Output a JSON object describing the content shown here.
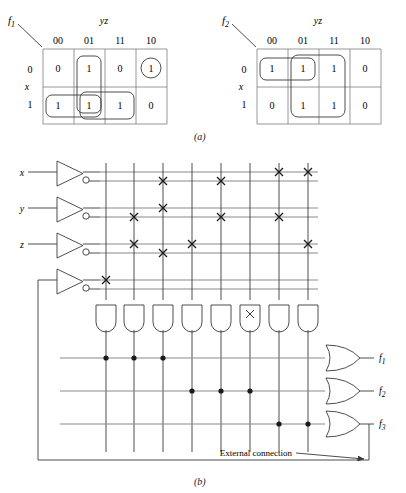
{
  "figure": {
    "caption_a": "(a)",
    "caption_b": "(b)"
  },
  "kmaps": [
    {
      "name": "f1",
      "function_label": "f",
      "function_sub": "1",
      "col_var_label": "yz",
      "row_var_label": "x",
      "col_headers": [
        "00",
        "01",
        "11",
        "10"
      ],
      "row_headers": [
        "0",
        "1"
      ],
      "cells": [
        [
          "0",
          "1",
          "0",
          "1"
        ],
        [
          "1",
          "1",
          "1",
          "0"
        ]
      ],
      "groups": [
        {
          "name": "circle-cell-row0-col10",
          "shape": "circle",
          "row": 0,
          "col_start": 3,
          "col_end": 3
        },
        {
          "name": "vertical-col01",
          "shape": "rect",
          "row_start": 0,
          "row_end": 1,
          "col_start": 1,
          "col_end": 1
        },
        {
          "name": "row1-col00-col01",
          "shape": "rect",
          "row_start": 1,
          "row_end": 1,
          "col_start": 0,
          "col_end": 1
        },
        {
          "name": "row1-col01-col11",
          "shape": "rect",
          "row_start": 1,
          "row_end": 1,
          "col_start": 1,
          "col_end": 2
        }
      ]
    },
    {
      "name": "f2",
      "function_label": "f",
      "function_sub": "2",
      "col_var_label": "yz",
      "row_var_label": "x",
      "col_headers": [
        "00",
        "01",
        "11",
        "10"
      ],
      "row_headers": [
        "0",
        "1"
      ],
      "cells": [
        [
          "1",
          "1",
          "1",
          "0"
        ],
        [
          "0",
          "1",
          "1",
          "0"
        ]
      ],
      "groups": [
        {
          "name": "row0-col00-col01",
          "shape": "rect",
          "row_start": 0,
          "row_end": 0,
          "col_start": 0,
          "col_end": 1
        },
        {
          "name": "col01-col11-both-rows",
          "shape": "rect",
          "row_start": 0,
          "row_end": 1,
          "col_start": 1,
          "col_end": 2
        }
      ]
    }
  ],
  "pla": {
    "inputs": [
      {
        "label": "x",
        "sub": ""
      },
      {
        "label": "y",
        "sub": ""
      },
      {
        "label": "z",
        "sub": ""
      },
      {
        "label": "",
        "sub": ""
      }
    ],
    "input_line_names": [
      "x",
      "x-complement",
      "y",
      "y-complement",
      "z",
      "z-complement",
      "w",
      "w-complement"
    ],
    "and_gate_count": 8,
    "or_gate_count": 3,
    "outputs": [
      {
        "label": "f",
        "sub": "1"
      },
      {
        "label": "f",
        "sub": "2"
      },
      {
        "label": "f",
        "sub": "3"
      }
    ],
    "and_plane_crosspoints": [
      {
        "row": 0,
        "col": 6
      },
      {
        "row": 0,
        "col": 7
      },
      {
        "row": 1,
        "col": 2
      },
      {
        "row": 1,
        "col": 4
      },
      {
        "row": 2,
        "col": 2
      },
      {
        "row": 3,
        "col": 1
      },
      {
        "row": 3,
        "col": 4
      },
      {
        "row": 3,
        "col": 6
      },
      {
        "row": 4,
        "col": 1
      },
      {
        "row": 4,
        "col": 3
      },
      {
        "row": 4,
        "col": 7
      },
      {
        "row": 5,
        "col": 2
      },
      {
        "row": 6,
        "col": 0
      }
    ],
    "and_gate_marks": [
      {
        "gate": 5,
        "mark": "x"
      }
    ],
    "or_plane_dots": [
      {
        "row": 0,
        "col": 0
      },
      {
        "row": 0,
        "col": 1
      },
      {
        "row": 0,
        "col": 2
      },
      {
        "row": 1,
        "col": 3
      },
      {
        "row": 1,
        "col": 4
      },
      {
        "row": 1,
        "col": 5
      },
      {
        "row": 2,
        "col": 6
      },
      {
        "row": 2,
        "col": 7
      }
    ],
    "external_connection_label": "External connection"
  },
  "colors": {
    "line": "#3a3a3a",
    "faint_line": "#8a8a8a",
    "text": "#1a1a1a",
    "background": "#ffffff"
  }
}
